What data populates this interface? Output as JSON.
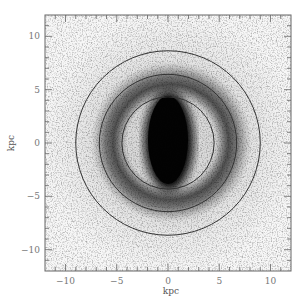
{
  "chart_data": {
    "type": "heatmap",
    "title": "",
    "xlabel": "kpc",
    "ylabel": "kpc",
    "xlim": [
      -12,
      12
    ],
    "ylim": [
      -12,
      12
    ],
    "x_ticks": [
      -10,
      -5,
      0,
      5,
      10
    ],
    "y_ticks": [
      -10,
      -5,
      0,
      5,
      10
    ],
    "x_tick_labels": [
      "−10",
      "−5",
      "0",
      "5",
      "10"
    ],
    "y_tick_labels": [
      "−10",
      "−5",
      "0",
      "5",
      "10"
    ],
    "minor_tick_step": 1,
    "grid": false,
    "legend": null,
    "colormap": "grayscale (darker = higher density)",
    "bar": {
      "center": [
        0,
        0
      ],
      "orientation": "vertical",
      "half_length_kpc": 4.6,
      "half_width_kpc": 2.2
    },
    "ring": {
      "inner_radius_kpc": 4.5,
      "outer_radius_kpc": 7.5,
      "peak_radius_kpc": 5.8
    },
    "circles": [
      {
        "name": "inner",
        "center": [
          0,
          0
        ],
        "radius_kpc": 4.5
      },
      {
        "name": "middle",
        "center": [
          0,
          0
        ],
        "radius_kpc": 6.7
      },
      {
        "name": "outer",
        "center": [
          0,
          0
        ],
        "radius_kpc": 9.0
      }
    ]
  },
  "axes": {
    "x_label": "kpc",
    "y_label": "kpc",
    "x_ticks": [
      {
        "value": -10,
        "label": "−10"
      },
      {
        "value": -5,
        "label": "−5"
      },
      {
        "value": 0,
        "label": "0"
      },
      {
        "value": 5,
        "label": "5"
      },
      {
        "value": 10,
        "label": "10"
      }
    ],
    "y_ticks": [
      {
        "value": 10,
        "label": "10"
      },
      {
        "value": 5,
        "label": "5"
      },
      {
        "value": 0,
        "label": "0"
      },
      {
        "value": -5,
        "label": "−5"
      },
      {
        "value": -10,
        "label": "−10"
      }
    ]
  },
  "colors": {
    "frame": "#666666",
    "circle": "#333333",
    "background_noise": "#f2f2f2",
    "bar": "#050505"
  }
}
